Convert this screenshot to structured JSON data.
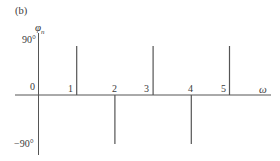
{
  "chart_data": {
    "type": "bar",
    "subtype": "line-spectrum (phase spectrum)",
    "panel_label": "(b)",
    "title": "",
    "xlabel": "ω",
    "ylabel": "φ",
    "ylabel_subscript": "n",
    "x": [
      1,
      2,
      3,
      4,
      5
    ],
    "categories": [
      "1",
      "2",
      "3",
      "4",
      "5"
    ],
    "values": [
      90,
      -90,
      90,
      -90,
      90
    ],
    "yticks": [
      "90°",
      "-90°"
    ],
    "ytick_values": [
      90,
      -90
    ],
    "xticks": [
      "0",
      "1",
      "2",
      "3",
      "4",
      "5"
    ],
    "ylim": [
      -90,
      90
    ],
    "xlim": [
      0,
      6
    ],
    "grid": false,
    "legend": null,
    "line_color": "#555555"
  },
  "labels": {
    "panel": "(b)",
    "y_symbol": "φ",
    "y_sub": "n",
    "y_top": "90°",
    "y_bottom": "−90°",
    "origin": "0",
    "x_symbol": "ω",
    "tick_1": "1",
    "tick_2": "2",
    "tick_3": "3",
    "tick_4": "4",
    "tick_5": "5"
  }
}
